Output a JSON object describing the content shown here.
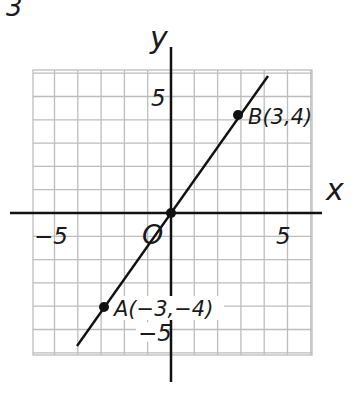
{
  "problem_number": "3",
  "axes": {
    "x_label": "x",
    "y_label": "y",
    "origin_label": "O",
    "x_ticks": [
      "−5",
      "5"
    ],
    "y_ticks": [
      "5",
      "−5"
    ]
  },
  "points": [
    {
      "name": "A",
      "label": "A(−3,−4)",
      "x": -3,
      "y": -4
    },
    {
      "name": "B",
      "label": "B(3,4)",
      "x": 3,
      "y": 4
    },
    {
      "name": "O",
      "label": "O",
      "x": 0,
      "y": 0
    }
  ],
  "colors": {
    "grid": "#bdbdbd",
    "ink": "#111111"
  },
  "chart_data": {
    "type": "line",
    "title": "",
    "xlabel": "x",
    "ylabel": "y",
    "xlim": [
      -6,
      6
    ],
    "ylim": [
      -6,
      6
    ],
    "grid": true,
    "series": [
      {
        "name": "line through A, O, B",
        "x": [
          -4,
          -3,
          0,
          3,
          4.5
        ],
        "y": [
          -5.3,
          -4,
          0,
          4,
          6
        ]
      }
    ],
    "points": [
      {
        "label": "A(−3,−4)",
        "x": -3,
        "y": -4
      },
      {
        "label": "O",
        "x": 0,
        "y": 0
      },
      {
        "label": "B(3,4)",
        "x": 3,
        "y": 4
      }
    ],
    "tick_labels": {
      "x": [
        "−5",
        "5"
      ],
      "y": [
        "5",
        "−5"
      ]
    }
  }
}
